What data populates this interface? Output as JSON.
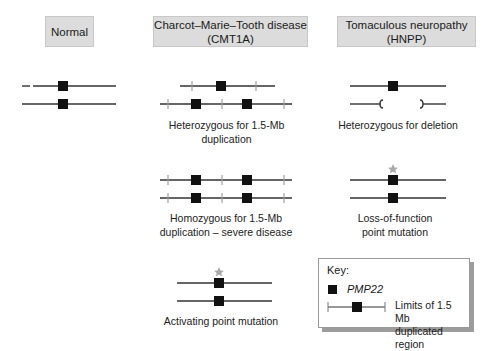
{
  "headers": {
    "normal": "Normal",
    "cmt1a": [
      "Charcot–Marie–Tooth disease",
      "(CMT1A)"
    ],
    "hnpp": [
      "Tomaculous neuropathy",
      "(HNPP)"
    ]
  },
  "labels": {
    "het_dup": [
      "Heterozygous for 1.5-Mb",
      "duplication"
    ],
    "het_del": "Heterozygous for deletion",
    "hom_dup": [
      "Homozygous for 1.5-Mb",
      "duplication – severe disease"
    ],
    "lof": [
      "Loss-of-function",
      "point mutation"
    ],
    "activating": "Activating point mutation"
  },
  "key": {
    "title": "Key:",
    "gene_label": "PMP22",
    "limits_label": [
      "Limits of 1.5 Mb",
      "duplicated region"
    ]
  },
  "colors": {
    "header_bg": "#dcdcdc",
    "line": "#333333",
    "tick": "#a0a0a0",
    "gene": "#111111",
    "star": "#a8a8a8",
    "key_shadow": "#9c9c9c"
  }
}
